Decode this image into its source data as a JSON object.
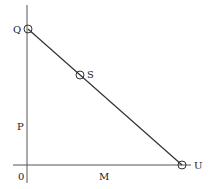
{
  "diagram": {
    "axes": {
      "origin_label": "0",
      "x_axis_label": "M",
      "y_axis_label": "P"
    },
    "points": [
      {
        "label": "Q",
        "x": 28,
        "y": 29
      },
      {
        "label": "S",
        "x": 80,
        "y": 75
      },
      {
        "label": "U",
        "x": 182,
        "y": 165
      }
    ],
    "line": {
      "from": "Q",
      "to": "U",
      "through": "S"
    },
    "colors": {
      "stroke": "#333333",
      "background": "#ffffff"
    }
  }
}
